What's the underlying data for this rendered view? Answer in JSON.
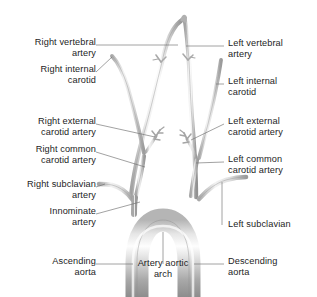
{
  "diagram": {
    "background_color": "#ffffff",
    "vessel_stroke_color": "#9a9a9a",
    "vessel_fill_light": "#e8e8e8",
    "arch_gradient_light": "#fdfdfd",
    "arch_gradient_mid": "#c9c9c9",
    "arch_gradient_dark": "#8d8d8d",
    "leader_line_color": "#6f6f6f",
    "text_color": "#1d1d1d"
  },
  "labels": {
    "right_vertebral_artery": "Right vertebral\nartery",
    "right_internal_carotid": "Right internal\ncarotid",
    "right_external_carotid_artery": "Right external\ncarotid artery",
    "right_common_carotid_artery": "Right common\ncarotid artery",
    "right_subclavian_artery": "Right subclavian\nartery",
    "innominate_artery": "Innominate\nartery",
    "ascending_aorta": "Ascending\naorta",
    "left_vertebral_artery": "Left vertebral\nartery",
    "left_internal_carotid": "Left internal\ncarotid",
    "left_external_carotid_artery": "Left external\ncarotid artery",
    "left_common_carotid_artery": "Left common\ncarotid artery",
    "left_subclavian": "Left subclavian",
    "descending_aorta": "Descending\naorta",
    "artery_aortic_arch": "Artery aortic\narch"
  }
}
